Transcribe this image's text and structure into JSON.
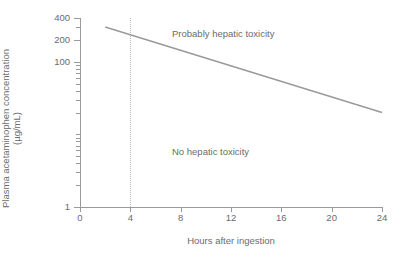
{
  "chart_data": {
    "type": "line",
    "title": "",
    "xlabel": "Hours after ingestion",
    "ylabel_line1": "Plasma acetaminophen concentration",
    "ylabel_line2": "(µg/mL)",
    "xlim": [
      0,
      24
    ],
    "ylim": [
      1,
      400
    ],
    "yscale": "log",
    "xscale": "linear",
    "grid": false,
    "legend": "none",
    "xticks": [
      {
        "value": 0,
        "label": "0"
      },
      {
        "value": 4,
        "label": "4"
      },
      {
        "value": 8,
        "label": "8"
      },
      {
        "value": 12,
        "label": "12"
      },
      {
        "value": 16,
        "label": "16"
      },
      {
        "value": 20,
        "label": "20"
      },
      {
        "value": 24,
        "label": "24"
      }
    ],
    "yticks_major": [
      {
        "value": 400,
        "label": "400"
      },
      {
        "value": 200,
        "label": "200"
      },
      {
        "value": 100,
        "label": "100"
      },
      {
        "value": 1,
        "label": "1"
      }
    ],
    "yticks_minor": [
      300,
      90,
      80,
      70,
      60,
      50,
      40,
      30,
      20,
      10,
      9,
      8,
      7,
      6,
      5,
      4,
      3,
      2
    ],
    "series": [
      {
        "name": "treatment-line",
        "color": "#9a9a9a",
        "style": "solid",
        "points": [
          {
            "x": 2,
            "y": 300
          },
          {
            "x": 24,
            "y": 20
          }
        ]
      }
    ],
    "reference_lines": [
      {
        "name": "4-hour-reference",
        "orientation": "vertical",
        "x": 4,
        "style": "dotted",
        "color": "#bcbcbc"
      }
    ],
    "annotations": [
      {
        "name": "probably-hepatic-toxicity",
        "text": "Probably hepatic toxicity",
        "x": 8.5,
        "y": 260
      },
      {
        "name": "no-hepatic-toxicity",
        "text": "No hepatic toxicity",
        "x": 8.5,
        "y": 12
      }
    ]
  },
  "axes": {
    "x_title": "Hours after ingestion",
    "y_title_line1": "Plasma acetaminophen concentration",
    "y_title_line2": "(µg/mL)"
  },
  "ticks": {
    "x": [
      "0",
      "4",
      "8",
      "12",
      "16",
      "20",
      "24"
    ],
    "y": [
      "400",
      "200",
      "100",
      "1"
    ]
  },
  "labels": {
    "toxic": "Probably hepatic toxicity",
    "nontoxic": "No hepatic toxicity"
  },
  "colors": {
    "axis": "#9a9a9a",
    "text": "#6b6b6b",
    "line": "#9a9a9a",
    "reference": "#bcbcbc",
    "background": "#ffffff"
  }
}
